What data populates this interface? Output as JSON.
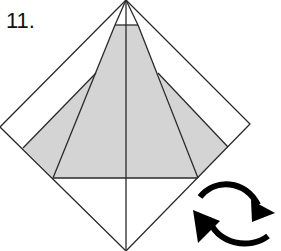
{
  "diagram": {
    "step_number": "11.",
    "colors": {
      "line": "#2a2a2a",
      "fill": "#d4d4d4",
      "background": "#ffffff"
    },
    "icon": "rotate-turn-over-icon"
  }
}
